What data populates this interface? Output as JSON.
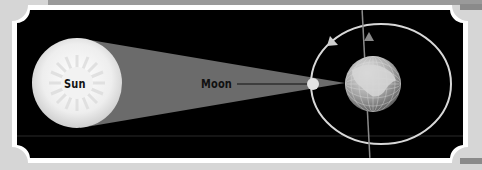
{
  "diagram": {
    "labels": {
      "sun": "Sun",
      "moon": "Moon"
    },
    "elements": [
      {
        "name": "sun",
        "shape": "circle",
        "cx": 72,
        "cy": 83,
        "r": 45,
        "color": "#e8e8e8"
      },
      {
        "name": "shadow-cone",
        "shape": "polygon",
        "color": "#6b6b6b"
      },
      {
        "name": "moon",
        "shape": "circle",
        "cx": 313,
        "cy": 84,
        "r": 6,
        "color": "#e0e0e0"
      },
      {
        "name": "earth",
        "shape": "circle",
        "cx": 373,
        "cy": 84,
        "r": 28,
        "color": "#9a9a9a"
      },
      {
        "name": "moon-orbit",
        "shape": "ellipse",
        "cx": 384,
        "cy": 84,
        "rx": 70,
        "ry": 60,
        "color": "#d8d8d8"
      },
      {
        "name": "earth-axis",
        "shape": "line",
        "color": "#888888"
      }
    ],
    "colors": {
      "background": "#000000",
      "frame": "#ffffff",
      "page": "#d6d6d6",
      "shadow": "#6b6b6b",
      "orbit": "#d8d8d8"
    }
  }
}
